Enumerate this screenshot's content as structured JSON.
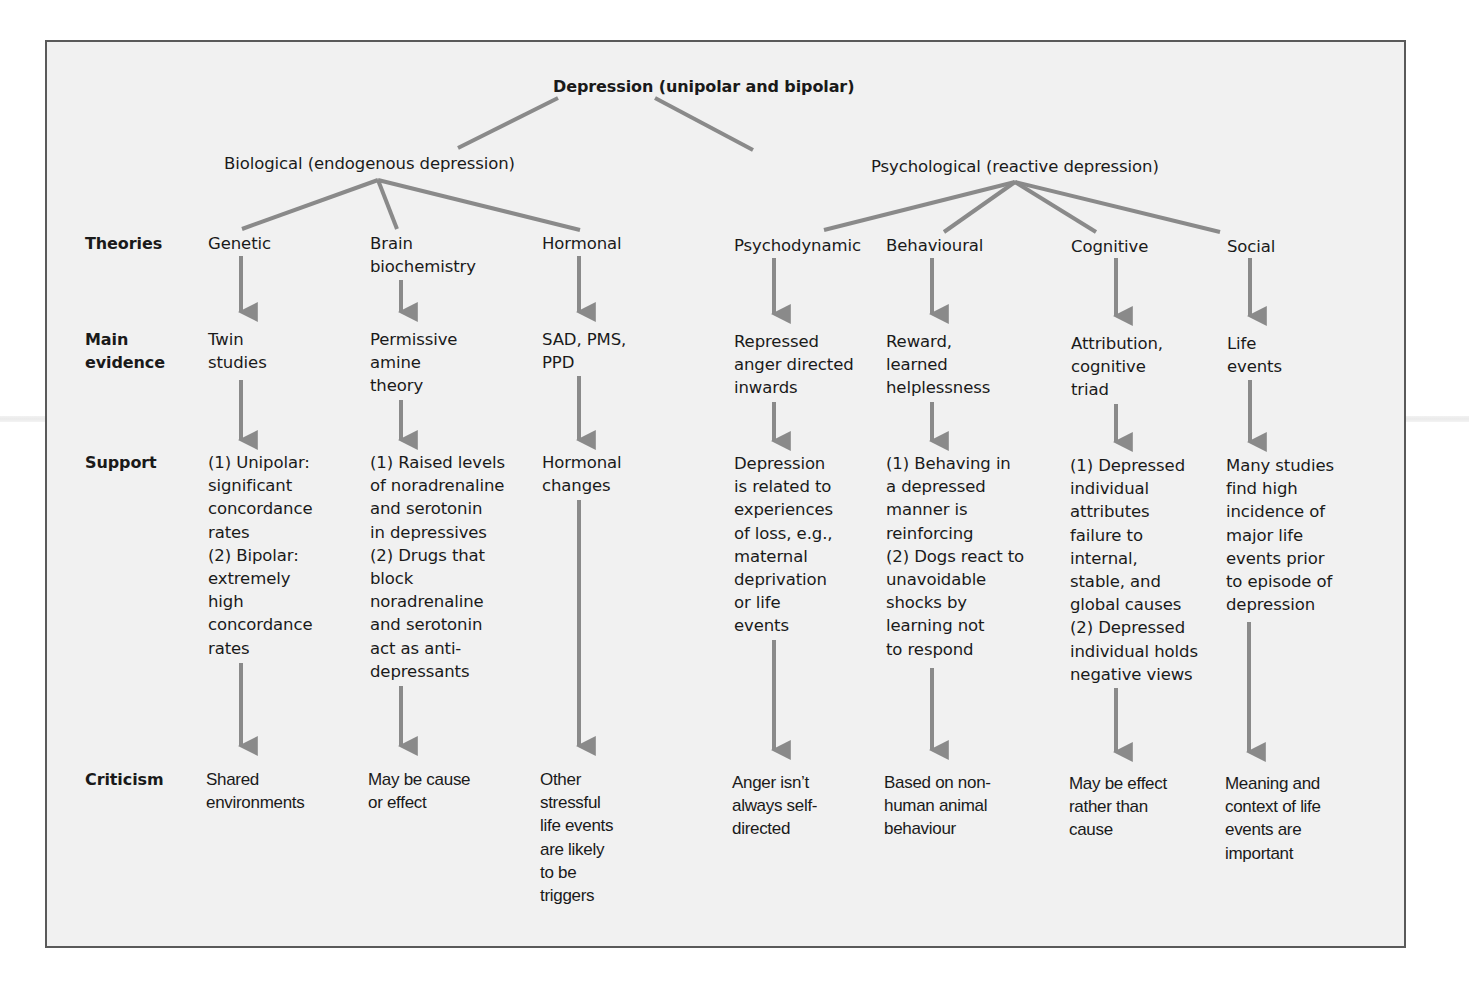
{
  "diagram": {
    "root": "Depression (unipolar and bipolar)",
    "branches": {
      "biological": "Biological (endogenous depression)",
      "psychological": "Psychological (reactive depression)"
    },
    "row_labels": {
      "theories": "Theories",
      "main_evidence": "Main\nevidence",
      "support": "Support",
      "criticism": "Criticism"
    },
    "columns": [
      {
        "branch": "biological",
        "theory": "Genetic",
        "evidence": "Twin\nstudies",
        "support": "(1) Unipolar:\nsignificant\nconcordance\nrates\n(2) Bipolar:\nextremely\nhigh\nconcordance\nrates",
        "criticism": "Shared\nenvironments"
      },
      {
        "branch": "biological",
        "theory": "Brain\nbiochemistry",
        "evidence": "Permissive\namine\ntheory",
        "support": "(1) Raised levels\nof noradrenaline\nand serotonin\nin depressives\n(2) Drugs that\nblock\nnoradrenaline\nand serotonin\nact as anti-\ndepressants",
        "criticism": "May be cause\nor effect"
      },
      {
        "branch": "biological",
        "theory": "Hormonal",
        "evidence": "SAD, PMS,\nPPD",
        "support": "Hormonal\nchanges",
        "criticism": "Other\nstressful\nlife events\nare likely\nto be\ntriggers"
      },
      {
        "branch": "psychological",
        "theory": "Psychodynamic",
        "evidence": "Repressed\nanger directed\ninwards",
        "support": "Depression\nis related to\nexperiences\nof loss, e.g.,\nmaternal\ndeprivation\nor life\nevents",
        "criticism": "Anger isn’t\nalways self-\ndirected"
      },
      {
        "branch": "psychological",
        "theory": "Behavioural",
        "evidence": "Reward,\nlearned\nhelplessness",
        "support": "(1) Behaving in\na depressed\nmanner is\nreinforcing\n(2) Dogs react to\nunavoidable\nshocks by\nlearning not\nto respond",
        "criticism": "Based on non-\nhuman animal\nbehaviour"
      },
      {
        "branch": "psychological",
        "theory": "Cognitive",
        "evidence": "Attribution,\ncognitive\ntriad",
        "support": "(1) Depressed\nindividual\nattributes\nfailure to\ninternal,\nstable, and\nglobal causes\n(2) Depressed\nindividual holds\nnegative views",
        "criticism": "May be effect\nrather than\ncause"
      },
      {
        "branch": "psychological",
        "theory": "Social",
        "evidence": "Life\nevents",
        "support": "Many studies\nfind high\nincidence of\nmajor life\nevents prior\nto episode of\ndepression",
        "criticism": "Meaning and\ncontext of life\nevents are\nimportant"
      }
    ],
    "colors": {
      "connector": "#8a8a8a",
      "frame_border": "#5a5a5a",
      "background": "#f1f1f1",
      "text": "#1a1a1a"
    }
  }
}
